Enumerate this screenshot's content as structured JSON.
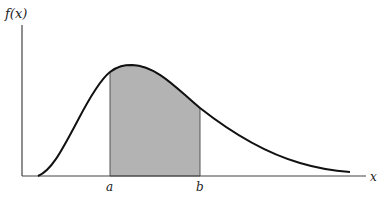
{
  "diagram": {
    "y_axis_label": "f(x)",
    "x_axis_label": "x",
    "lower_bound_label": "a",
    "upper_bound_label": "b",
    "curve_color": "#111111",
    "shade_color": "#b3b3b3",
    "axis_color": "#444444"
  }
}
